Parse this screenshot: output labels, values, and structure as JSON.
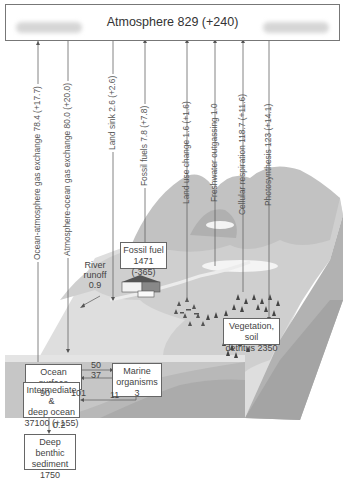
{
  "atmosphere": {
    "label": "Atmosphere 829 (+240)"
  },
  "fluxes": [
    {
      "id": "ocean-atmosphere",
      "label": "Ocean-atmosphere gas exchange 78.4 (+17.7)",
      "direction": "up"
    },
    {
      "id": "atmosphere-ocean",
      "label": "Atmosphere-ocean gas exchange 80.0 (+20.0)",
      "direction": "down"
    },
    {
      "id": "land-sink",
      "label": "Land sink 2.6 (+2.6)",
      "direction": "down"
    },
    {
      "id": "fossil-fuels",
      "label": "Fossil fuels 7.8 (+7.8)",
      "direction": "up"
    },
    {
      "id": "land-use-change",
      "label": "Land use change 1.6 (+1.6)",
      "direction": "up"
    },
    {
      "id": "freshwater-outgassing",
      "label": "Freshwater outgassing 1.0",
      "direction": "up"
    },
    {
      "id": "cellular-respiration",
      "label": "Cellular respiration 118.7 (+11.6)",
      "direction": "up"
    },
    {
      "id": "photosynthesis",
      "label": "Photosynthesis 123 (+14.1)",
      "direction": "down"
    }
  ],
  "reservoirs": {
    "fossil_fuel": {
      "line1": "Fossil fuel",
      "line2": "1471 (-365)"
    },
    "vegetation": {
      "line1": "Vegetation, soil",
      "line2": "detritus 2350"
    },
    "ocean_surface": {
      "line1": "Ocean surface",
      "line2": "900"
    },
    "marine_organisms": {
      "line1": "Marine",
      "line2": "organisms",
      "line3": "3"
    },
    "deep_ocean": {
      "line1": "Intermediate &",
      "line2": "deep ocean",
      "line3": "37100 (+155)"
    },
    "benthic": {
      "line1": "Deep benthic",
      "line2": "sediment",
      "line3": "1750"
    }
  },
  "river_runoff": {
    "line1": "River",
    "line2": "runoff",
    "line3": "0.9"
  },
  "internal_flows": {
    "surface_to_marine": "50",
    "marine_to_surface": "37",
    "surface_to_deep": "90",
    "deep_to_surface": "101",
    "marine_to_deep": "11",
    "deep_to_benthic": "0.2"
  },
  "colors": {
    "land": "#d4d4d4",
    "ocean_top": "#e8e8e8",
    "block_front": "#bdbdbd",
    "block_side": "#a8a8a8",
    "line": "#666666"
  }
}
